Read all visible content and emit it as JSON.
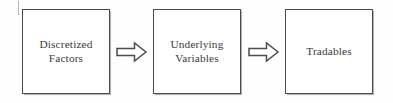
{
  "diagram": {
    "type": "flow-diagram",
    "background_color": "#fefefe",
    "canvas": {
      "width": 393,
      "height": 103
    },
    "node_style": {
      "border_color": "#4a4a4a",
      "fill_color": "#ffffff",
      "text_color": "#3c3a3a"
    },
    "connector_style": {
      "shape": "block-arrow",
      "direction": "right",
      "outline_color": "#4e4c4c",
      "fill_color": "#ffffff"
    },
    "nodes": [
      {
        "id": "discretized-factors",
        "lines": [
          "Discretized",
          "Factors"
        ],
        "line1": "Discretized",
        "line2": "Factors",
        "x": 22,
        "y": 9,
        "width": 88,
        "height": 85
      },
      {
        "id": "underlying-variables",
        "lines": [
          "Underlying",
          "Variables"
        ],
        "line1": "Underlying",
        "line2": "Variables",
        "x": 153,
        "y": 9,
        "width": 88,
        "height": 85
      },
      {
        "id": "tradables",
        "lines": [
          "Tradables"
        ],
        "line1": "Tradables",
        "line2": "",
        "x": 285,
        "y": 9,
        "width": 88,
        "height": 85
      }
    ],
    "connectors": [
      {
        "id": "arrow-factors-to-variables",
        "from": "discretized-factors",
        "to": "underlying-variables",
        "label": "",
        "x": 116,
        "y": 42,
        "width": 31,
        "height": 20
      },
      {
        "id": "arrow-variables-to-tradables",
        "from": "underlying-variables",
        "to": "tradables",
        "label": "",
        "x": 248,
        "y": 42,
        "width": 31,
        "height": 20
      }
    ]
  }
}
